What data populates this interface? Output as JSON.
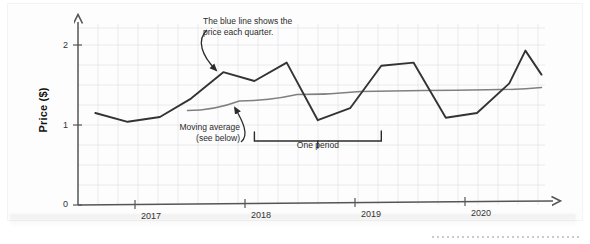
{
  "figure": {
    "y_axis_title": "Price ($)",
    "y_ticks": [
      "0",
      "1",
      "2"
    ],
    "x_ticks": [
      "2017",
      "2018",
      "2019",
      "2020"
    ],
    "annotations": {
      "series_note": "The blue line shows the\nprice each quarter.",
      "moving_average_note": "Moving average\n(see below)",
      "period_note": "One period"
    },
    "colors": {
      "series_line": "#333333",
      "moving_average_line": "#808080",
      "axis": "#555555",
      "grid": "#e3e3e8",
      "paper": "#fdfdfd",
      "annotation_text": "#2b2b2b"
    }
  },
  "chart_data": {
    "type": "line",
    "title": "",
    "xlabel": "",
    "ylabel": "Price ($)",
    "ylim": [
      0,
      2.25
    ],
    "xlim": [
      2016.5,
      2020.55
    ],
    "grid": true,
    "legend": "none",
    "x_tick_values": [
      2017,
      2018,
      2019,
      2020
    ],
    "x_tick_labels": [
      "2017",
      "2018",
      "2019",
      "2020"
    ],
    "y_tick_values": [
      0,
      1,
      2
    ],
    "y_tick_labels": [
      "0",
      "1",
      "2"
    ],
    "x": [
      2016.65,
      2016.93,
      2017.21,
      2017.48,
      2017.76,
      2018.03,
      2018.31,
      2018.58,
      2018.86,
      2019.13,
      2019.41,
      2019.69,
      2019.96,
      2020.24,
      2020.38,
      2020.52
    ],
    "series": [
      {
        "name": "Price each quarter",
        "color": "#333333",
        "values": [
          1.15,
          1.04,
          1.1,
          1.33,
          1.66,
          1.55,
          1.78,
          1.06,
          1.21,
          1.74,
          1.78,
          1.09,
          1.15,
          1.52,
          1.93,
          1.63
        ]
      },
      {
        "name": "Moving average",
        "color": "#808080",
        "x": [
          2017.45,
          2017.9,
          2018.4,
          2018.95,
          2019.5,
          2020.05,
          2020.52
        ],
        "values": [
          1.18,
          1.3,
          1.38,
          1.42,
          1.43,
          1.44,
          1.47
        ]
      }
    ],
    "annotations": [
      {
        "text": "The blue line shows the price each quarter.",
        "points_to_series": "Price each quarter",
        "points_to_x": 2017.76
      },
      {
        "text": "Moving average (see below)",
        "points_to_series": "Moving average",
        "points_to_x": 2018.0
      },
      {
        "text": "One period",
        "type": "span-bracket",
        "from_x": 2018.03,
        "to_x": 2019.13
      }
    ]
  }
}
